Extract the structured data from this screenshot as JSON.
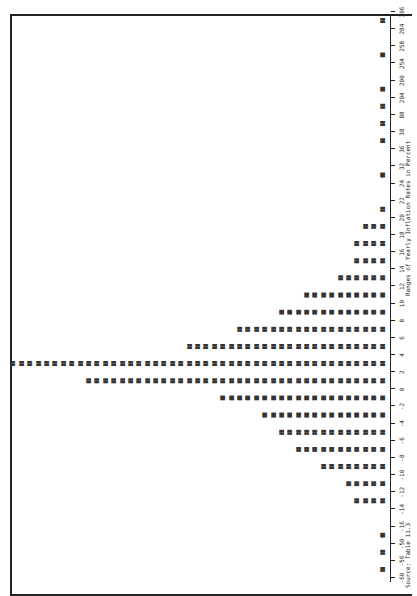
{
  "chart_data": {
    "type": "bar",
    "orientation": "rotated 90deg (axis runs along right edge, bars extend leftward)",
    "title": "",
    "xlabel": "Ranges of Yearly Inflation Rates in Percent",
    "ylabel": "Number of years (stacked year labels)",
    "source": "Source: Table 11.3",
    "tick_labels": [
      "-60",
      "-56",
      "-50",
      "-16",
      "-14",
      "-12",
      "-10",
      "-8",
      "-6",
      "-4",
      "-2",
      "0",
      "2",
      "4",
      "6",
      "8",
      "10",
      "12",
      "14",
      "16",
      "18",
      "20",
      "22",
      "24",
      "32",
      "36",
      "38",
      "88",
      "204",
      "200",
      "254",
      "258",
      "284",
      "306"
    ],
    "categories": [
      "-60",
      "-56",
      "-50",
      "-16",
      "-14",
      "-12",
      "-10",
      "-8",
      "-6",
      "-4",
      "-2",
      "0",
      "2",
      "4",
      "6",
      "8",
      "10",
      "12",
      "14",
      "16",
      "18",
      "20",
      "22",
      "24",
      "32",
      "36",
      "38",
      "88",
      "204",
      "200",
      "254",
      "258",
      "284"
    ],
    "values": [
      1,
      1,
      1,
      0,
      4,
      5,
      8,
      11,
      13,
      15,
      20,
      36,
      45,
      24,
      18,
      13,
      10,
      6,
      4,
      4,
      3,
      1,
      0,
      1,
      0,
      1,
      1,
      1,
      1,
      0,
      1,
      0,
      1
    ],
    "annotations": [
      "1726",
      "1735",
      "1728",
      "1805",
      "1741",
      "1864",
      "1776",
      "1778",
      "1779",
      "1777",
      "1780",
      "1779"
    ],
    "ylim": [
      0,
      45
    ],
    "grid": false,
    "legend": "none"
  }
}
